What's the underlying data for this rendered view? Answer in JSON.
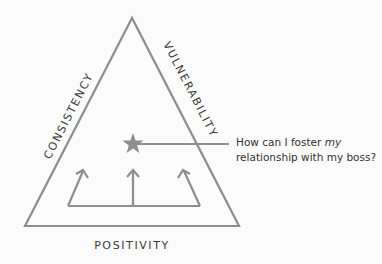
{
  "diagram": {
    "type": "triangle-framework",
    "sides": {
      "left": "CONSISTENCY",
      "right": "VULNERABILITY",
      "bottom": "POSITIVITY"
    },
    "center_marker": "star-icon",
    "question": {
      "line1_prefix": "How can I foster ",
      "line1_emphasis": "my",
      "line2": "relationship with my boss?"
    },
    "arrows_count": 3,
    "colors": {
      "stroke": "#8e8e8e",
      "text": "#333333",
      "background": "#fbfbfb"
    }
  }
}
